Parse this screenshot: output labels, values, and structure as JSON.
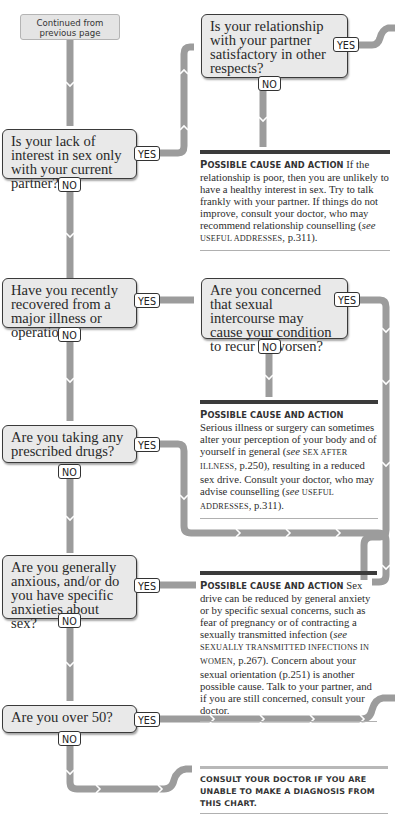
{
  "start": {
    "label": "Continued from previous page",
    "line1": "Continued from",
    "line2": "previous page"
  },
  "tags": {
    "yes": "YES",
    "no": "NO"
  },
  "questions": [
    {
      "id": "q1",
      "text": "Is your lack of interest in sex only with your current partner?"
    },
    {
      "id": "q1b",
      "text": "Is your relationship with your partner satisfactory in other respects?"
    },
    {
      "id": "q2",
      "text": "Have you recently recovered from a major illness or operation?"
    },
    {
      "id": "q2b",
      "text": "Are you concerned that sexual intercourse may cause your condition to recur or worsen?"
    },
    {
      "id": "q3",
      "text": "Are you taking any prescribed drugs?"
    },
    {
      "id": "q4",
      "text": "Are you generally anxious, and/or do you have specific anxieties about sex?"
    },
    {
      "id": "q5",
      "text": "Are you over 50?"
    }
  ],
  "results": [
    {
      "heading_first": "P",
      "heading_rest": "OSSIBLE CAUSE AND ACTION",
      "body_1": "If the relationship is poor, then you are unlikely to have a healthy interest in sex. Try to talk frankly with your partner. If things do not improve, consult your doctor, who may recommend relationship counselling (",
      "see": "see",
      "ref": "USEFUL ADDRESSES",
      "body_2": ", p.311)."
    },
    {
      "heading_first": "P",
      "heading_rest": "OSSIBLE CAUSE AND ACTION",
      "body_1": "Serious illness or surgery can sometimes alter your perception of your body and of yourself in general (",
      "see": "see",
      "ref": "SEX AFTER ILLNESS",
      "body_2": ", p.250), resulting in a reduced sex drive. Consult your doctor, who may advise counselling (",
      "see2": "see",
      "ref2": "USEFUL ADDRESSES",
      "body_3": ", p.311)."
    },
    {
      "heading_first": "P",
      "heading_rest": "OSSIBLE CAUSE AND ACTION",
      "body_1": "Sex drive can be reduced by general anxiety or by specific sexual concerns, such as fear of pregnancy or of contracting a sexually transmitted infection (",
      "see": "see",
      "ref": "SEXUALLY TRANSMITTED INFECTIONS IN WOMEN",
      "body_2": ", p.267). Concern about your sexual orientation (p.251) is another possible cause. Talk to your partner, and if you are still concerned, consult your doctor."
    }
  ],
  "final_note": "CONSULT YOUR DOCTOR IF YOU ARE UNABLE TO MAKE A DIAGNOSIS FROM THIS CHART.",
  "colors": {
    "connector": "#9a9a9a",
    "box_fill": "#e9e9e9",
    "box_border": "#3a3a3a",
    "rule_dark": "#3b3b3b"
  }
}
